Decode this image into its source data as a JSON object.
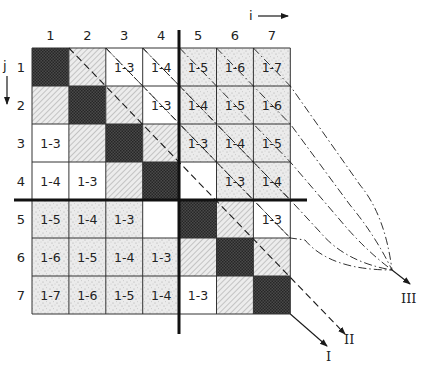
{
  "axes": {
    "i_label": "i",
    "j_label": "j",
    "columns": [
      "1",
      "2",
      "3",
      "4",
      "5",
      "6",
      "7"
    ],
    "rows": [
      "1",
      "2",
      "3",
      "4",
      "5",
      "6",
      "7"
    ]
  },
  "grid": {
    "size": 7,
    "partition_after": 4,
    "cells": [
      [
        {
          "t": "dark",
          "v": ""
        },
        {
          "t": "hatch",
          "v": ""
        },
        {
          "t": "white",
          "v": "1-3"
        },
        {
          "t": "white",
          "v": "1-4"
        },
        {
          "t": "stipple",
          "v": "1-5"
        },
        {
          "t": "stipple",
          "v": "1-6"
        },
        {
          "t": "stipple",
          "v": "1-7"
        }
      ],
      [
        {
          "t": "hatch",
          "v": ""
        },
        {
          "t": "dark",
          "v": ""
        },
        {
          "t": "hatch",
          "v": ""
        },
        {
          "t": "white",
          "v": "1-3"
        },
        {
          "t": "stipple",
          "v": "1-4"
        },
        {
          "t": "stipple",
          "v": "1-5"
        },
        {
          "t": "stipple",
          "v": "1-6"
        }
      ],
      [
        {
          "t": "white",
          "v": "1-3"
        },
        {
          "t": "hatch",
          "v": ""
        },
        {
          "t": "dark",
          "v": ""
        },
        {
          "t": "hatch",
          "v": ""
        },
        {
          "t": "stipple",
          "v": "1-3"
        },
        {
          "t": "stipple",
          "v": "1-4"
        },
        {
          "t": "stipple",
          "v": "1-5"
        }
      ],
      [
        {
          "t": "white",
          "v": "1-4"
        },
        {
          "t": "white",
          "v": "1-3"
        },
        {
          "t": "hatch",
          "v": ""
        },
        {
          "t": "dark",
          "v": ""
        },
        {
          "t": "white",
          "v": ""
        },
        {
          "t": "stipple",
          "v": "1-3"
        },
        {
          "t": "stipple",
          "v": "1-4"
        }
      ],
      [
        {
          "t": "stipple",
          "v": "1-5"
        },
        {
          "t": "stipple",
          "v": "1-4"
        },
        {
          "t": "stipple",
          "v": "1-3"
        },
        {
          "t": "white",
          "v": ""
        },
        {
          "t": "dark",
          "v": ""
        },
        {
          "t": "hatch",
          "v": ""
        },
        {
          "t": "white",
          "v": "1-3"
        }
      ],
      [
        {
          "t": "stipple",
          "v": "1-6"
        },
        {
          "t": "stipple",
          "v": "1-5"
        },
        {
          "t": "stipple",
          "v": "1-4"
        },
        {
          "t": "stipple",
          "v": "1-3"
        },
        {
          "t": "hatch",
          "v": ""
        },
        {
          "t": "dark",
          "v": ""
        },
        {
          "t": "hatch",
          "v": ""
        }
      ],
      [
        {
          "t": "stipple",
          "v": "1-7"
        },
        {
          "t": "stipple",
          "v": "1-6"
        },
        {
          "t": "stipple",
          "v": "1-5"
        },
        {
          "t": "stipple",
          "v": "1-4"
        },
        {
          "t": "white",
          "v": "1-3"
        },
        {
          "t": "hatch",
          "v": ""
        },
        {
          "t": "dark",
          "v": ""
        }
      ]
    ]
  },
  "outputs": [
    {
      "id": "I",
      "label": "I",
      "style": "solid"
    },
    {
      "id": "II",
      "label": "II",
      "style": "dashed"
    },
    {
      "id": "III",
      "label": "III",
      "style": "dash-dot"
    }
  ],
  "colors": {
    "line": "#1a1a1a",
    "dark": "#3a3a3a",
    "hatch_bg": "#e6e6e6",
    "stipple_bg": "#e9e9e9",
    "white": "#ffffff"
  }
}
